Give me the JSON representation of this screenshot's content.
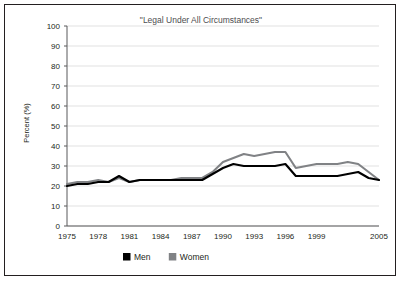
{
  "chart_data": {
    "type": "line",
    "title": "\"Legal Under All Circumstances\"",
    "xlabel": "",
    "ylabel": "Percent (%)",
    "ylim": [
      0,
      100
    ],
    "ytick_values": [
      0,
      10,
      20,
      30,
      40,
      50,
      60,
      70,
      80,
      90,
      100
    ],
    "ytick_labels": [
      "0",
      "10",
      "20",
      "30",
      "40",
      "50",
      "60",
      "70",
      "80",
      "90",
      "100"
    ],
    "xlim": [
      1975,
      2005
    ],
    "xtick_labels": [
      "1975",
      "1978",
      "1981",
      "1984",
      "1987",
      "1990",
      "1993",
      "1996",
      "1999",
      "2005"
    ],
    "xtick_values": [
      1975,
      1978,
      1981,
      1984,
      1987,
      1990,
      1993,
      1996,
      1999,
      2005
    ],
    "grid": "horizontal",
    "legend_position": "below-axis-left",
    "x": [
      1975,
      1976,
      1977,
      1978,
      1979,
      1980,
      1981,
      1982,
      1983,
      1984,
      1985,
      1986,
      1987,
      1988,
      1989,
      1990,
      1991,
      1992,
      1993,
      1994,
      1995,
      1996,
      1997,
      1998,
      1999,
      2000,
      2001,
      2002,
      2003,
      2004,
      2005
    ],
    "series": [
      {
        "name": "Men",
        "color": "#000000",
        "values": [
          20,
          21,
          21,
          22,
          22,
          25,
          22,
          23,
          23,
          23,
          23,
          23,
          23,
          23,
          26,
          29,
          31,
          30,
          30,
          30,
          30,
          31,
          25,
          25,
          25,
          25,
          25,
          26,
          27,
          24,
          23
        ]
      },
      {
        "name": "Women",
        "color": "#808285",
        "values": [
          21,
          22,
          22,
          23,
          22,
          24,
          22,
          23,
          23,
          23,
          23,
          24,
          24,
          24,
          27,
          32,
          34,
          36,
          35,
          36,
          37,
          37,
          29,
          30,
          31,
          31,
          31,
          32,
          31,
          27,
          23
        ]
      }
    ],
    "legend": [
      {
        "label": "Men",
        "color": "#000000",
        "swatch": "square"
      },
      {
        "label": "Women",
        "color": "#808285",
        "swatch": "square"
      }
    ]
  }
}
